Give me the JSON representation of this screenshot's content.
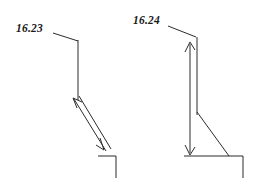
{
  "page": {
    "background_color": "#ffffff",
    "ink_color": "#2b2b2b",
    "text_color": "#1a1a1a",
    "width": 265,
    "height": 187
  },
  "figures": [
    {
      "id": "figure-left",
      "label": "16.23",
      "label_position": {
        "x": 16,
        "y": 32
      },
      "description": "Technical sketch: leader line from label to a vertical wall line, with an inclined double-headed dimension arrow down to a stepped base.",
      "geometry": {
        "leader": "M 53,33 L 78,41",
        "vertical_wall": "M 78,40 L 78,100",
        "dimension_arrow_up_shaft": "M 74,99 L 106,151",
        "dimension_arrow_down_shaft": "M 79,96 L 111,149",
        "arrowhead_upper": "M 73,98 L 82,102 M 73,98 L 77,108",
        "arrowhead_lower": "M 104,150 L 96,145 M 104,150 L 100,138",
        "base_horizontal": "M 98,156 L 116,156",
        "base_vertical": "M 116,156 L 116,178"
      }
    },
    {
      "id": "figure-right",
      "label": "16.24",
      "label_position": {
        "x": 133,
        "y": 24
      },
      "description": "Technical sketch: leader line from label to the top of a wall, a vertical double-headed height dimension arrow, an inclined back face, and a stepped base.",
      "geometry": {
        "leader": "M 168,26 L 196,37",
        "wall_vertical_right": "M 197,37 L 197,115",
        "height_arrow_shaft": "M 190,44 L 190,153",
        "arrowhead_top": "M 190,42 L 185,52 M 190,42 L 195,50",
        "arrowhead_bottom": "M 190,155 L 185,145 M 190,155 L 195,147",
        "inclined_face": "M 197,112 L 229,156",
        "base_horizontal": "M 184,156 L 243,156",
        "base_vertical": "M 243,156 L 243,178"
      }
    }
  ]
}
